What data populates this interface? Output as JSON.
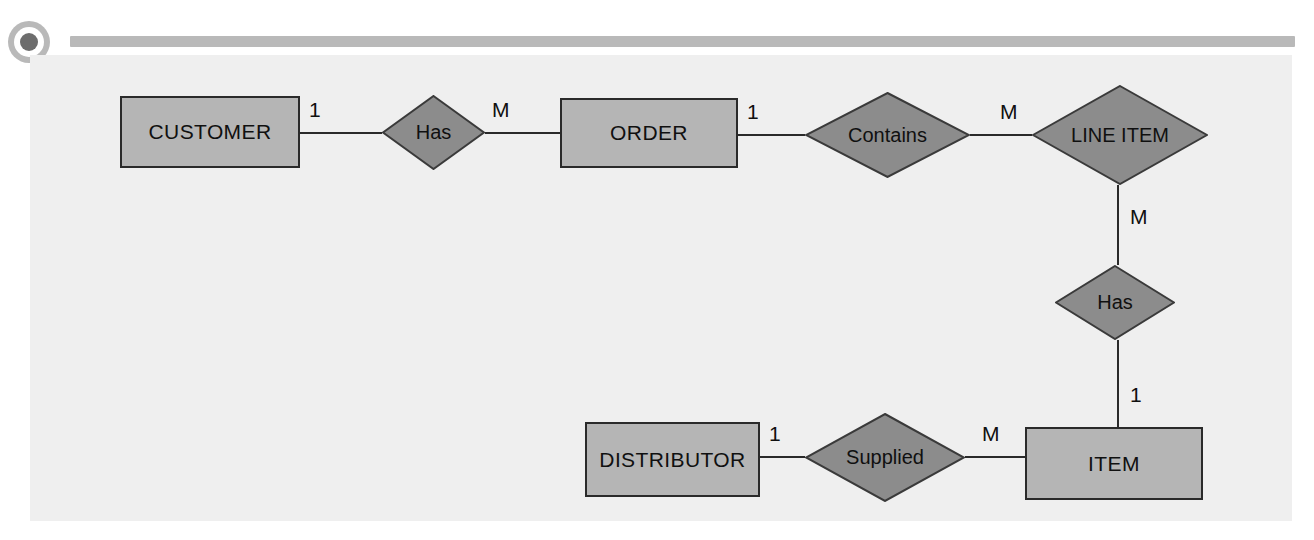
{
  "page": {
    "canvas_background": "#efefef",
    "page_background": "#ffffff"
  },
  "header": {
    "bullet_icon": "filled-circle-icon",
    "bar_color": "#b9b9b9",
    "dot_color": "#6d6d6d"
  },
  "style": {
    "entity_fill": "#b5b5b5",
    "entity_border": "#2a2a2a",
    "relationship_fill": "#8c8c8c",
    "relationship_border": "#3a3a3a",
    "line_color": "#2a2a2a",
    "text_color": "#101010"
  },
  "diagram": {
    "type": "entity-relationship",
    "notation": "Chen",
    "entities": [
      {
        "id": "customer",
        "label": "CUSTOMER",
        "shape": "rectangle",
        "x": 120,
        "y": 96,
        "w": 180,
        "h": 72
      },
      {
        "id": "order",
        "label": "ORDER",
        "shape": "rectangle",
        "x": 560,
        "y": 98,
        "w": 178,
        "h": 70
      },
      {
        "id": "line_item",
        "label": "LINE ITEM",
        "shape": "diamond",
        "x": 1032,
        "y": 85,
        "w": 176,
        "h": 100
      },
      {
        "id": "distributor",
        "label": "DISTRIBUTOR",
        "shape": "rectangle",
        "x": 585,
        "y": 422,
        "w": 175,
        "h": 75
      },
      {
        "id": "item",
        "label": "ITEM",
        "shape": "rectangle",
        "x": 1025,
        "y": 427,
        "w": 178,
        "h": 73
      }
    ],
    "relationships": [
      {
        "id": "has_order",
        "label": "Has",
        "shape": "diamond",
        "x": 382,
        "y": 95,
        "w": 103,
        "h": 75
      },
      {
        "id": "contains",
        "label": "Contains",
        "shape": "diamond",
        "x": 805,
        "y": 92,
        "w": 165,
        "h": 86
      },
      {
        "id": "has_item",
        "label": "Has",
        "shape": "diamond",
        "x": 1055,
        "y": 265,
        "w": 120,
        "h": 75
      },
      {
        "id": "supplied",
        "label": "Supplied",
        "shape": "diamond",
        "x": 805,
        "y": 413,
        "w": 160,
        "h": 89
      }
    ],
    "connections": [
      {
        "id": "customer-has",
        "from": "customer",
        "to": "has_order",
        "cardinality": "1",
        "x1": 300,
        "y1": 133,
        "x2": 382,
        "y2": 133
      },
      {
        "id": "has-order",
        "from": "has_order",
        "to": "order",
        "cardinality": "M",
        "x1": 485,
        "y1": 133,
        "x2": 560,
        "y2": 133
      },
      {
        "id": "order-contains",
        "from": "order",
        "to": "contains",
        "cardinality": "1",
        "x1": 738,
        "y1": 135,
        "x2": 805,
        "y2": 135
      },
      {
        "id": "contains-lineitem",
        "from": "contains",
        "to": "line_item",
        "cardinality": "M",
        "x1": 970,
        "y1": 135,
        "x2": 1032,
        "y2": 135
      },
      {
        "id": "lineitem-has",
        "from": "line_item",
        "to": "has_item",
        "cardinality": "M",
        "x1": 1118,
        "y1": 185,
        "x2": 1118,
        "y2": 265
      },
      {
        "id": "has-item",
        "from": "has_item",
        "to": "item",
        "cardinality": "1",
        "x1": 1118,
        "y1": 340,
        "x2": 1118,
        "y2": 427
      },
      {
        "id": "distributor-supp",
        "from": "distributor",
        "to": "supplied",
        "cardinality": "1",
        "x1": 760,
        "y1": 457,
        "x2": 805,
        "y2": 457
      },
      {
        "id": "supp-item",
        "from": "supplied",
        "to": "item",
        "cardinality": "M",
        "x1": 965,
        "y1": 457,
        "x2": 1025,
        "y2": 457
      }
    ],
    "cardinality_labels": [
      {
        "id": "card-customer-has",
        "text": "1",
        "x": 309,
        "y": 98
      },
      {
        "id": "card-has-order",
        "text": "M",
        "x": 492,
        "y": 98
      },
      {
        "id": "card-order-contains",
        "text": "1",
        "x": 747,
        "y": 100
      },
      {
        "id": "card-contains-lineitem",
        "text": "M",
        "x": 1000,
        "y": 100
      },
      {
        "id": "card-lineitem-has",
        "text": "M",
        "x": 1130,
        "y": 205
      },
      {
        "id": "card-has-item",
        "text": "1",
        "x": 1130,
        "y": 383
      },
      {
        "id": "card-distributor-supp",
        "text": "1",
        "x": 769,
        "y": 422
      },
      {
        "id": "card-supp-item",
        "text": "M",
        "x": 982,
        "y": 422
      }
    ]
  }
}
